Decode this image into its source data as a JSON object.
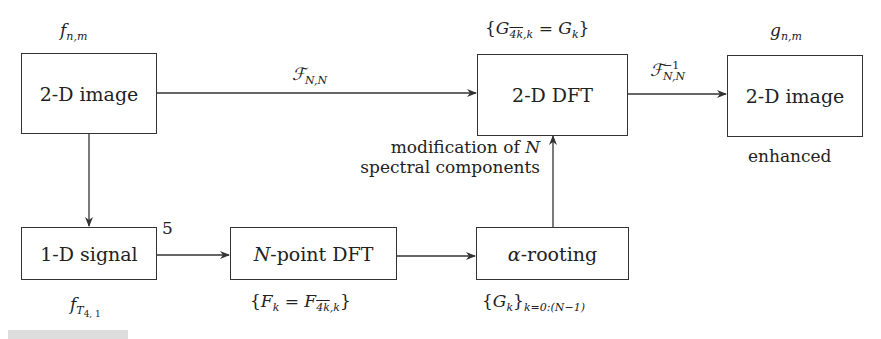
{
  "boxes": {
    "image_in": "2-D image",
    "dft2d": "2-D DFT",
    "image_out": "2-D image",
    "signal1d": "1-D signal",
    "npoint_dft_var": "N",
    "npoint_dft_rest": "-point DFT",
    "alpha_var": "α",
    "alpha_rest": "-rooting"
  },
  "labels": {
    "f_nm_base": "f",
    "f_nm_sub": "n,m",
    "g_nm_base": "g",
    "g_nm_sub": "n,m",
    "F_NN_base": "ℱ",
    "F_NN_sub": "N,N",
    "Finv_base": "ℱ",
    "Finv_sup": "−1",
    "Finv_sub": "N,N",
    "G_set_open": "{G",
    "G_set_sub_over": "4k",
    "G_set_sub_rest": ",k",
    "G_set_mid": " = G",
    "G_set_sub2": "k",
    "G_set_close": "}",
    "enhanced": "enhanced",
    "modification_line1_text": "modification of ",
    "modification_line1_var": "N",
    "modification_line2": "spectral components",
    "five": "5",
    "fT_base": "f",
    "fT_sub": "T",
    "fT_subsub": "4, 1",
    "F_set_open": "{F",
    "F_set_sub": "k",
    "F_set_mid": " = F",
    "F_set_sub_over": "4k",
    "F_set_sub_rest": ",k",
    "F_set_close": "}",
    "Gk_open": "{G",
    "Gk_sub": "k",
    "Gk_close": "}",
    "Gk_range": "k=0:(N−1)"
  },
  "colors": {
    "line": "#333333",
    "text": "#222222"
  }
}
